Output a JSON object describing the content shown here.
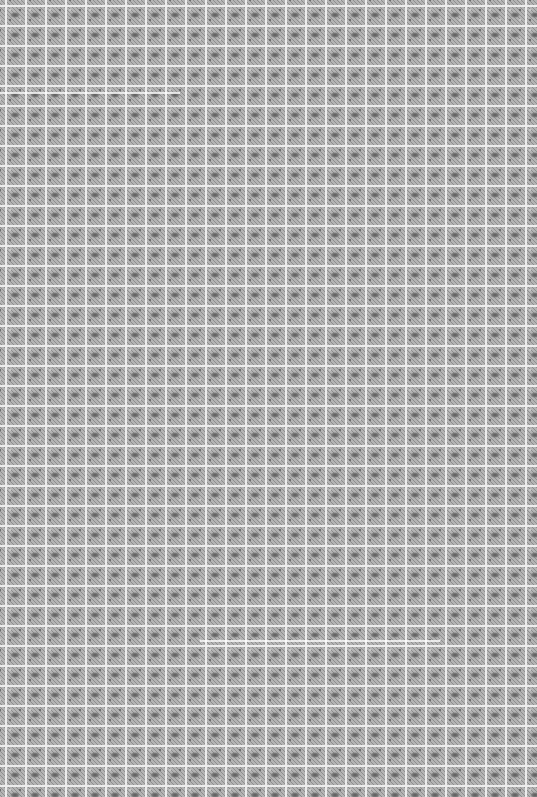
{
  "image": {
    "description": "Seamless gray tiled texture pattern",
    "tile_size_px": 20,
    "colors": {
      "grout": "#ececec",
      "tile_base": "#a2a2a2",
      "tile_motif_dark": "#5a5a5a",
      "tile_speckle_light": "#c8c8c8"
    },
    "streaks": [
      {
        "y": 92,
        "x_start": 0,
        "x_end": 180
      },
      {
        "y": 640,
        "x_start": 200,
        "x_end": 440
      }
    ]
  }
}
